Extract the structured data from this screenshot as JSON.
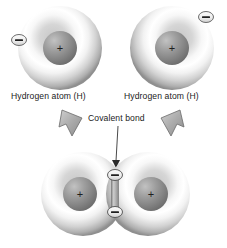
{
  "figure": {
    "type": "diagram",
    "background_color": "#ffffff"
  },
  "labels": {
    "hydrogen_left": "Hydrogen atom (H)",
    "hydrogen_right": "Hydrogen atom (H)",
    "covalent_bond": "Covalent bond"
  },
  "symbols": {
    "proton": "+",
    "electron": "–"
  },
  "colors": {
    "shell_outer_edge": "#9a9a9a",
    "shell_highlight": "#ffffff",
    "shell_mid": "#c9c9c9",
    "nucleus_light": "#b4b4b4",
    "nucleus_dark": "#6e6e6e",
    "electron_fill": "#ededed",
    "electron_stroke": "#5c5c5c",
    "bond_bar": "#b0b0b0",
    "arrow_fill": "#a8a8a8",
    "arrow_stroke": "#6b6b6b",
    "pointer_line": "#4a4a4a",
    "text": "#1b1b1b"
  },
  "atoms": [
    {
      "id": "top-left-hydrogen",
      "shell": {
        "cx": 60,
        "cy": 48,
        "r": 42
      },
      "nucleus": {
        "cx": 60,
        "cy": 48,
        "r": 17
      },
      "proton": "+",
      "electrons": [
        {
          "cx": 19,
          "cy": 40,
          "rx": 7.5,
          "ry": 5.5,
          "sign": "–"
        }
      ]
    },
    {
      "id": "top-right-hydrogen",
      "shell": {
        "cx": 172,
        "cy": 48,
        "r": 42
      },
      "nucleus": {
        "cx": 172,
        "cy": 48,
        "r": 17
      },
      "proton": "+",
      "electrons": [
        {
          "cx": 206,
          "cy": 17,
          "rx": 7.5,
          "ry": 5.5,
          "sign": "–"
        }
      ]
    },
    {
      "id": "molecule-left-hydrogen",
      "shell": {
        "cx": 83,
        "cy": 194,
        "r": 42
      },
      "nucleus": {
        "cx": 80,
        "cy": 194,
        "r": 17
      },
      "proton": "+",
      "electrons": []
    },
    {
      "id": "molecule-right-hydrogen",
      "shell": {
        "cx": 148,
        "cy": 194,
        "r": 42
      },
      "nucleus": {
        "cx": 151,
        "cy": 194,
        "r": 17
      },
      "proton": "+",
      "electrons": []
    }
  ],
  "shared_electrons": [
    {
      "cx": 115,
      "cy": 175,
      "rx": 7.5,
      "ry": 5.5,
      "sign": "–"
    },
    {
      "cx": 115,
      "cy": 212,
      "rx": 7.5,
      "ry": 5.5,
      "sign": "–"
    }
  ],
  "bond_bar": {
    "x": 111,
    "y": 177,
    "width": 8,
    "height": 34
  },
  "arrows": [
    {
      "id": "arrow-left",
      "direction": "down-right"
    },
    {
      "id": "arrow-right",
      "direction": "down-left"
    }
  ],
  "pointer": {
    "from_x": 118,
    "from_y": 126,
    "to_x": 116,
    "to_y": 166
  }
}
